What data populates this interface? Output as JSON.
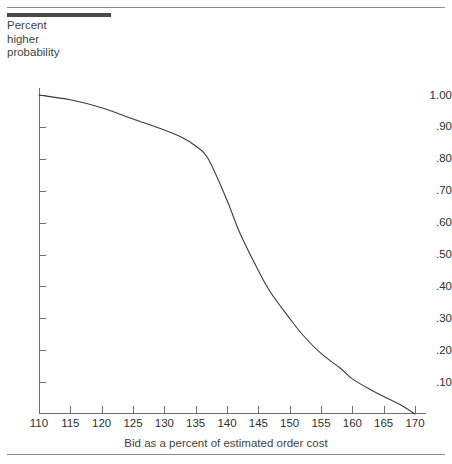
{
  "figure": {
    "header_caption": "probability of a higher bid as a percent of estimated order cost",
    "y_axis_title_lines": [
      "Percent",
      "higher",
      "probability"
    ],
    "x_axis_title": "Bid as a percent of estimated order cost",
    "line_color": "#3c3c3c",
    "axis_color": "#6e6e6e",
    "rule_color": "#8d8d8d",
    "thick_rule_color": "#4b4b4b",
    "background_color": "#ffffff"
  },
  "chart_data": {
    "type": "line",
    "title": "",
    "xlabel": "Bid as a percent of estimated order cost",
    "ylabel": "Percent higher probability",
    "xlim": [
      110,
      170
    ],
    "ylim": [
      0.0,
      1.0
    ],
    "grid": false,
    "legend": "none",
    "xticks": [
      110,
      115,
      120,
      125,
      130,
      135,
      140,
      145,
      150,
      155,
      160,
      165,
      170
    ],
    "xtick_labels": [
      "110",
      "115",
      "120",
      "125",
      "130",
      "135",
      "140",
      "145",
      "150",
      "155",
      "160",
      "165",
      "170"
    ],
    "yticks": [
      1.0,
      0.9,
      0.8,
      0.7,
      0.6,
      0.5,
      0.4,
      0.3,
      0.2,
      0.1
    ],
    "ytick_labels": [
      "1.00",
      ".90",
      ".80",
      ".70",
      ".60",
      ".50",
      ".40",
      ".30",
      ".20",
      ".10"
    ],
    "series": [
      {
        "name": "Probability of a higher competing bid",
        "x": [
          110,
          115,
          120,
          125,
          130,
          133,
          135,
          137,
          140,
          142,
          145,
          147,
          150,
          152,
          155,
          158,
          160,
          163,
          165,
          168,
          170
        ],
        "y": [
          1.0,
          0.985,
          0.96,
          0.925,
          0.89,
          0.865,
          0.84,
          0.8,
          0.67,
          0.57,
          0.45,
          0.38,
          0.3,
          0.25,
          0.19,
          0.145,
          0.11,
          0.075,
          0.055,
          0.025,
          0.0
        ]
      }
    ]
  }
}
